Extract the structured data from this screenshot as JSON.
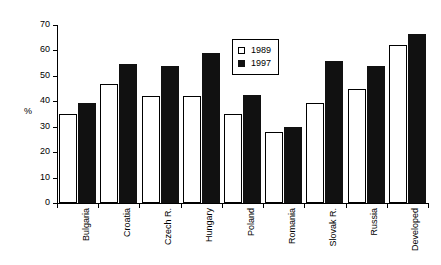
{
  "chart_data": {
    "type": "bar",
    "title": "",
    "subtitle": "",
    "xlabel": "",
    "ylabel": "%",
    "ylim": [
      0,
      70
    ],
    "ytick_step": 10,
    "yticks": [
      0,
      10,
      20,
      30,
      40,
      50,
      60,
      70
    ],
    "ytick_labels": [
      "0",
      "10",
      "20",
      "30",
      "40",
      "50",
      "60",
      "70"
    ],
    "grid": false,
    "legend_position": "upper-center-inside",
    "categories": [
      "Bulgaria",
      "Croatia",
      "Czech R.",
      "Hungary",
      "Poland",
      "Romania",
      "Slovak R.",
      "Russia",
      "Developed"
    ],
    "series": [
      {
        "name": "1989",
        "color": "#ffffff",
        "edge_color": "#000000",
        "values": [
          35,
          47,
          42,
          42,
          35,
          28,
          39.5,
          45,
          62
        ]
      },
      {
        "name": "1997",
        "color": "#111111",
        "edge_color": "#111111",
        "values": [
          39.5,
          54.5,
          54,
          59,
          42.5,
          30,
          56,
          54,
          66.5
        ]
      }
    ],
    "annotations": []
  },
  "legend": {
    "items": [
      {
        "label": "1989",
        "swatch": "open-square-icon"
      },
      {
        "label": "1997",
        "swatch": "filled-square-icon"
      }
    ]
  },
  "axes": {
    "y_title": "%"
  }
}
